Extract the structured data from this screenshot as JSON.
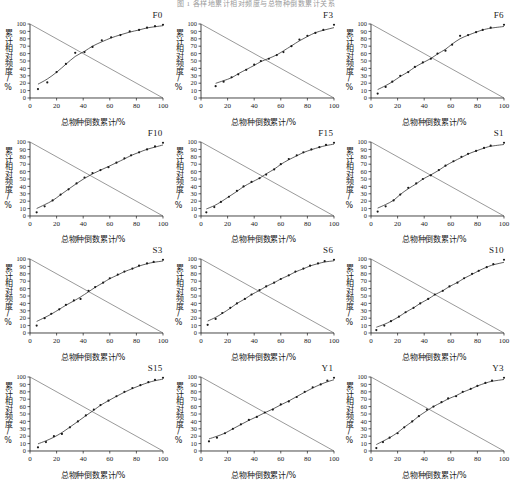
{
  "caption": "图 1 各样地累计相对频度与总物种倒数累计关系",
  "axes": {
    "ylabel": "累计相对频度/%",
    "xlabel": "总物种倒数累计/%",
    "xticks": [
      "0",
      "20",
      "40",
      "60",
      "80",
      "100"
    ],
    "yticks": [
      "0",
      "10",
      "20",
      "30",
      "40",
      "50",
      "60",
      "70",
      "80",
      "90",
      "100"
    ],
    "xlim": [
      0,
      100
    ],
    "ylim": [
      0,
      100
    ]
  },
  "colors": {
    "axis": "#1a1a1a",
    "point": "#1a1a1a",
    "fit_curve": "#2a2a2a",
    "reference_line": "#555555",
    "background": "#ffffff"
  },
  "chart_data": {
    "type": "scatter",
    "title": "各样地累计相对频度与总物种倒数累计关系",
    "xlabel": "总物种倒数累计/%",
    "ylabel": "累计相对频度/%",
    "xlim": [
      0,
      100
    ],
    "ylim": [
      0,
      100
    ],
    "grid": false,
    "legend": "none",
    "reference_line": {
      "name": "descending diagonal",
      "from": [
        0,
        100
      ],
      "to": [
        100,
        0
      ]
    },
    "panels": [
      {
        "label": "F0",
        "x": [
          6,
          13,
          20,
          27,
          34,
          41,
          47,
          54,
          61,
          68,
          75,
          82,
          88,
          94,
          100
        ],
        "y": [
          12,
          21,
          35,
          46,
          61,
          62,
          69,
          78,
          82,
          85,
          90,
          92,
          95,
          97,
          99
        ]
      },
      {
        "label": "F3",
        "x": [
          11,
          17,
          23,
          28,
          34,
          40,
          45,
          51,
          57,
          62,
          68,
          74,
          80,
          86,
          92,
          100
        ],
        "y": [
          16,
          22,
          28,
          32,
          38,
          45,
          50,
          53,
          58,
          62,
          70,
          79,
          84,
          88,
          92,
          99
        ]
      },
      {
        "label": "F6",
        "x": [
          5,
          11,
          16,
          22,
          28,
          33,
          39,
          45,
          50,
          56,
          61,
          67,
          73,
          79,
          84,
          90,
          100
        ],
        "y": [
          6,
          15,
          22,
          30,
          35,
          42,
          48,
          53,
          60,
          64,
          72,
          84,
          85,
          89,
          92,
          95,
          99
        ]
      },
      {
        "label": "F10",
        "x": [
          5,
          11,
          17,
          23,
          29,
          35,
          41,
          47,
          53,
          59,
          65,
          71,
          76,
          82,
          88,
          94,
          100
        ],
        "y": [
          5,
          13,
          21,
          29,
          36,
          44,
          52,
          58,
          62,
          66,
          72,
          78,
          82,
          86,
          90,
          94,
          99
        ]
      },
      {
        "label": "F15",
        "x": [
          4,
          10,
          15,
          21,
          27,
          32,
          38,
          44,
          49,
          55,
          60,
          66,
          72,
          77,
          83,
          89,
          94,
          100
        ],
        "y": [
          5,
          12,
          19,
          26,
          34,
          40,
          46,
          51,
          56,
          63,
          70,
          77,
          82,
          86,
          90,
          93,
          96,
          99
        ]
      },
      {
        "label": "S1",
        "x": [
          5,
          11,
          17,
          22,
          28,
          34,
          39,
          45,
          51,
          56,
          62,
          68,
          73,
          79,
          85,
          90,
          100
        ],
        "y": [
          6,
          13,
          21,
          29,
          38,
          44,
          50,
          55,
          62,
          68,
          74,
          80,
          84,
          88,
          92,
          95,
          99
        ]
      },
      {
        "label": "S3",
        "x": [
          5,
          11,
          16,
          22,
          27,
          33,
          38,
          44,
          49,
          55,
          60,
          66,
          71,
          77,
          82,
          88,
          93,
          100
        ],
        "y": [
          10,
          20,
          26,
          32,
          38,
          44,
          46,
          57,
          62,
          68,
          74,
          79,
          83,
          87,
          91,
          94,
          96,
          99
        ]
      },
      {
        "label": "S6",
        "x": [
          5,
          11,
          16,
          22,
          27,
          33,
          38,
          44,
          49,
          55,
          60,
          66,
          71,
          77,
          82,
          88,
          93,
          100
        ],
        "y": [
          11,
          19,
          27,
          34,
          40,
          46,
          52,
          58,
          63,
          68,
          73,
          78,
          83,
          87,
          91,
          94,
          97,
          99
        ]
      },
      {
        "label": "S10",
        "x": [
          4,
          10,
          15,
          21,
          26,
          32,
          37,
          43,
          48,
          54,
          59,
          65,
          70,
          76,
          81,
          87,
          92,
          100
        ],
        "y": [
          4,
          10,
          16,
          22,
          28,
          34,
          40,
          46,
          52,
          57,
          63,
          68,
          74,
          80,
          84,
          89,
          93,
          99
        ]
      },
      {
        "label": "S15",
        "x": [
          6,
          12,
          18,
          24,
          30,
          36,
          42,
          48,
          53,
          59,
          65,
          71,
          77,
          83,
          89,
          94,
          100
        ],
        "y": [
          5,
          12,
          20,
          23,
          32,
          40,
          48,
          56,
          62,
          68,
          74,
          80,
          85,
          89,
          93,
          96,
          99
        ]
      },
      {
        "label": "Y1",
        "x": [
          6,
          12,
          18,
          24,
          30,
          36,
          42,
          48,
          54,
          60,
          66,
          72,
          78,
          84,
          90,
          95,
          100
        ],
        "y": [
          13,
          18,
          24,
          30,
          36,
          42,
          46,
          52,
          56,
          63,
          67,
          73,
          80,
          86,
          90,
          95,
          99
        ]
      },
      {
        "label": "Y3",
        "x": [
          4,
          9,
          14,
          20,
          25,
          31,
          36,
          42,
          47,
          53,
          58,
          64,
          69,
          75,
          80,
          86,
          91,
          100
        ],
        "y": [
          4,
          12,
          18,
          24,
          32,
          40,
          47,
          56,
          60,
          66,
          71,
          74,
          80,
          84,
          88,
          92,
          95,
          99
        ]
      }
    ]
  }
}
